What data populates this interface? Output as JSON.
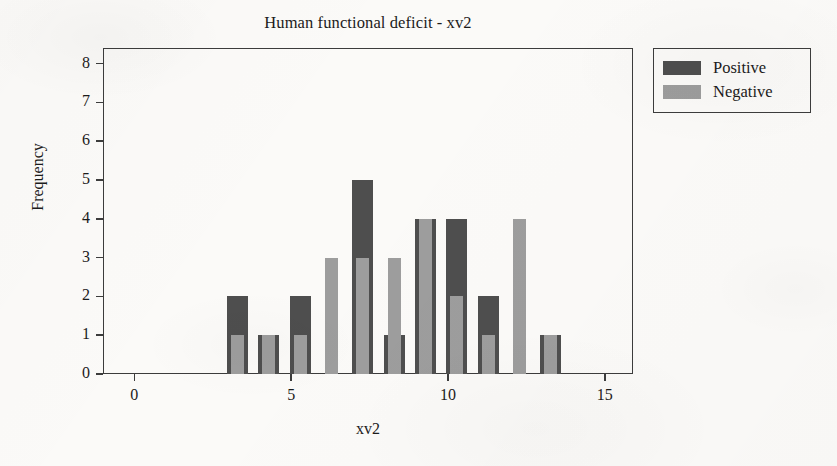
{
  "chart_data": {
    "type": "bar",
    "title": "Human functional deficit - xv2",
    "xlabel": "xv2",
    "ylabel": "Frequency",
    "xlim": [
      -1,
      15.9
    ],
    "ylim": [
      0,
      8.4
    ],
    "grid": false,
    "legend_position": "outside-right-top",
    "bar_style": "overlapping",
    "x": [
      0,
      1,
      2,
      3,
      4,
      5,
      6,
      7,
      8,
      9,
      10,
      13
    ],
    "xtick_labels": [
      "0",
      "5",
      "10",
      "15"
    ],
    "xtick_values": [
      0,
      5,
      10,
      15
    ],
    "ytick_labels": [
      "0",
      "1",
      "2",
      "3",
      "4",
      "5",
      "6",
      "7",
      "8"
    ],
    "ytick_values": [
      0,
      1,
      2,
      3,
      4,
      5,
      6,
      7,
      8
    ],
    "series": [
      {
        "name": "Positive",
        "color": "#4e4e4e",
        "values": [
          2,
          1,
          2,
          0,
          5,
          1,
          4,
          4,
          2,
          0,
          1,
          1
        ]
      },
      {
        "name": "Negative",
        "color": "#9d9d9d",
        "values": [
          1,
          1,
          1,
          3,
          3,
          3,
          4,
          2,
          1,
          4,
          1,
          0
        ]
      }
    ]
  },
  "legend": {
    "entries": [
      {
        "label": "Positive",
        "swatch": "#4e4e4e"
      },
      {
        "label": "Negative",
        "swatch": "#9d9d9d"
      }
    ]
  },
  "colors": {
    "positive": "#4e4e4e",
    "negative": "#9d9d9d",
    "axis": "#3c3c3c",
    "text": "#1b1b1b",
    "background": "#fbfaf8"
  }
}
